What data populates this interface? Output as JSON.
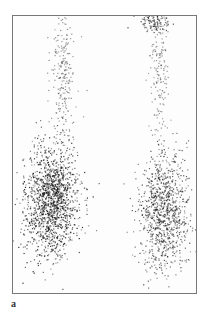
{
  "figure": {
    "panel_label": "a",
    "colors": {
      "background": "#ffffff",
      "border": "#777777",
      "uptake": "#111111"
    },
    "regions": [
      {
        "name": "left-upper-tract",
        "cx": 50,
        "cy": 60,
        "rx": 10,
        "ry": 60,
        "density": 0.25
      },
      {
        "name": "left-lower-cluster",
        "cx": 38,
        "cy": 185,
        "rx": 22,
        "ry": 45,
        "density": 0.9
      },
      {
        "name": "right-upper-spot",
        "cx": 140,
        "cy": 5,
        "rx": 12,
        "ry": 8,
        "density": 0.7
      },
      {
        "name": "right-upper-tract",
        "cx": 145,
        "cy": 55,
        "rx": 9,
        "ry": 55,
        "density": 0.2
      },
      {
        "name": "right-lower-cluster",
        "cx": 150,
        "cy": 195,
        "rx": 20,
        "ry": 48,
        "density": 0.65
      }
    ]
  }
}
